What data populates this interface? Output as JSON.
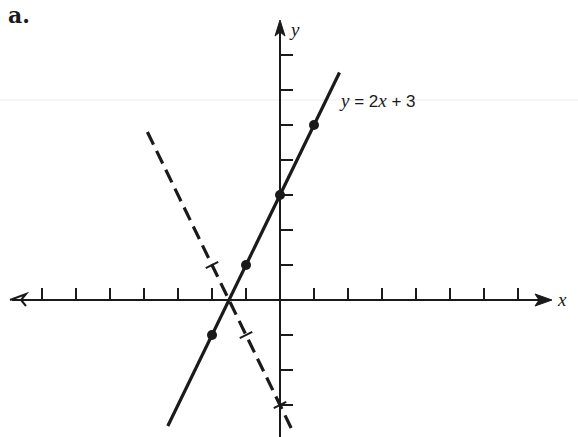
{
  "panel_label": "a.",
  "axes": {
    "x_label": "x",
    "y_label": "y",
    "origin_px": [
      280,
      300
    ],
    "unit_px_x": 34,
    "unit_px_y": 35,
    "x_ticks": [
      -7,
      -6,
      -5,
      -4,
      -3,
      -2,
      -1,
      1,
      2,
      3,
      4,
      5,
      6,
      7
    ],
    "y_ticks": [
      -3,
      -2,
      -1,
      1,
      2,
      3,
      4,
      5,
      6,
      7
    ]
  },
  "equation_label": {
    "y": "y",
    "eq": " = 2",
    "x": "x",
    "rest": " + 3"
  },
  "colors": {
    "ink": "#1a1a1a",
    "background": "#ffffff"
  },
  "chart_data": {
    "type": "line",
    "title": "a.",
    "xlabel": "x",
    "ylabel": "y",
    "xlim": [
      -7.5,
      8
    ],
    "ylim": [
      -4,
      8
    ],
    "grid": false,
    "legend": "none",
    "annotations": [
      "y = 2x + 3"
    ],
    "series": [
      {
        "name": "y = 2x + 3",
        "style": "solid",
        "marker": "dot",
        "x": [
          -2,
          -1,
          0,
          1
        ],
        "y": [
          -1,
          1,
          3,
          5
        ],
        "line_extent_x": [
          -3.3,
          1.75
        ]
      },
      {
        "name": "y = -2x - 3",
        "style": "dashed",
        "marker": "cross",
        "x": [
          -2,
          -1,
          0
        ],
        "y": [
          1,
          -1,
          -3
        ],
        "line_extent_x": [
          -3.9,
          0.4
        ]
      }
    ],
    "intersection": {
      "x": -1.5,
      "y": 0
    }
  }
}
